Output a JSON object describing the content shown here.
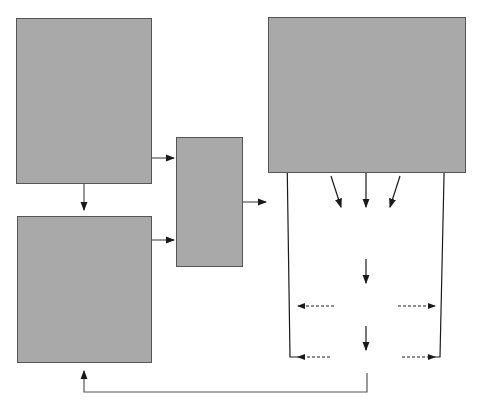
{
  "stable_parameters": {
    "title_line1": "RELATIVELY STABLE",
    "title_line2": "SYSTEM PARAMETERS",
    "items": [
      {
        "num": "1.",
        "text": "Basic attributes of the problem area (good)"
      },
      {
        "num": "2.",
        "text": "Basic distribution of natural resources"
      },
      {
        "num": "3.",
        "text": "Fundamental socio-cultural values and social structure"
      },
      {
        "num": "4.",
        "text": "Basic constitutional structure (rules)"
      }
    ]
  },
  "external_events": {
    "title_line1": "EVENTS EXTERNAL",
    "title_line2": "TO SUBSYSTEM",
    "items": [
      {
        "num": "1.",
        "text": "Changes in socio-economic conditions and technology"
      },
      {
        "num": "2.",
        "text": "Changes in systemic governing coalition"
      },
      {
        "num": "3.",
        "text": "Policy decisions and impacts from other subsystems"
      }
    ]
  },
  "constraints": {
    "line1": "Constraints",
    "line2": "and",
    "line3": "Resources",
    "line4": "of",
    "line5": "Subsystem",
    "line6": "Actors"
  },
  "policy_subsystem": {
    "title": "POLICY SUBSYSTEM",
    "coalition_a": {
      "name": "Coalition A",
      "belief": "A. Belief system",
      "resources": "B. Resources"
    },
    "coalition_b": {
      "name": "Coalition B",
      "belief": "A. Belief system",
      "resources": "B. Resources"
    },
    "brokers_line1": "Policy",
    "brokers_line2": "Brokers",
    "strategy_a_line1": "Strategy",
    "strategy_a_line2": "A:",
    "strategy_b_line1": "Strategy",
    "strategy_b_line2": "B:",
    "gov_line1": "Government",
    "gov_line2": "Action Program",
    "gov_line3": "(Collective Choice",
    "gov_line4": "Level)",
    "outputs_line1": "Policy Outputs",
    "outputs_line2": "(Operational",
    "outputs_line3": "Level)",
    "impacts": "Policy Impacts",
    "feedback_left": "Internal Feedback Loop",
    "feedback_right": "Internal Feedback Loop"
  },
  "colors": {
    "box_fill": "#a9a9a9",
    "border": "#555555",
    "line": "#1a1a1a"
  }
}
